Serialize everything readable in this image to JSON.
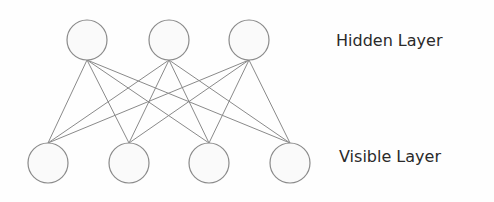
{
  "labels": {
    "hidden": "Hidden Layer",
    "visible": "Visible Layer"
  },
  "colors": {
    "stroke": "#8a8a8a",
    "node_fill": "#fafafa",
    "text": "#2a2a2a"
  },
  "layers": {
    "hidden_nodes": [
      {
        "cx": 87,
        "cy": 40
      },
      {
        "cx": 169,
        "cy": 40
      },
      {
        "cx": 249,
        "cy": 40
      }
    ],
    "visible_nodes": [
      {
        "cx": 48,
        "cy": 163
      },
      {
        "cx": 129,
        "cy": 163
      },
      {
        "cx": 209,
        "cy": 163
      },
      {
        "cx": 290,
        "cy": 163
      }
    ],
    "node_radius": 20,
    "fully_connected": true
  }
}
